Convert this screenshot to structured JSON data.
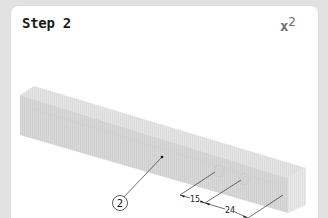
{
  "step": {
    "title": "Step 2",
    "quantity_prefix": "x",
    "quantity_value": "2"
  },
  "diagram": {
    "part": {
      "name": "rectangular wooden beam with two pre-drilled holes",
      "callout_label": "2"
    },
    "dimensions": [
      {
        "label": "15"
      },
      {
        "label": "24"
      }
    ]
  },
  "colors": {
    "page_background": "#e2e2e2",
    "card_background": "#ffffff",
    "title_text": "#1a1a1a",
    "quantity_text": "#6c6c6c",
    "beam_top": "#e3e3e3",
    "beam_front": "#d6d6d6",
    "beam_end": "#e9e9e9",
    "line": "#333333"
  }
}
